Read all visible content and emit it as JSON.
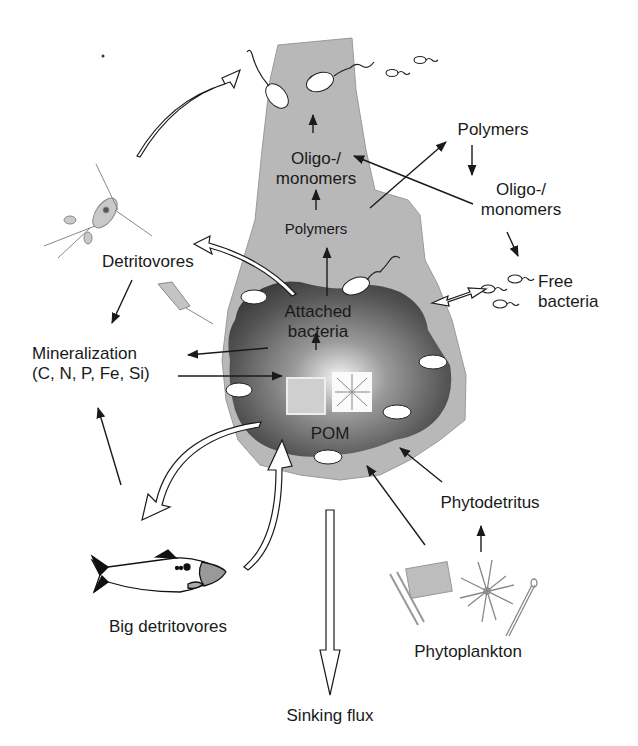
{
  "figure": {
    "colors": {
      "background": "#ffffff",
      "plume_gray": "#b5b5b5",
      "aggregate_dark": "#4a4a4a",
      "aggregate_center": "#f2f2f2",
      "bacteria_fill": "#ffffff",
      "ink": "#1a1a1a"
    }
  },
  "labels": {
    "plume_oligo_line1": "Oligo-/",
    "plume_oligo_line2": "monomers",
    "plume_polymers": "Polymers",
    "right_polymers": "Polymers",
    "right_oligo_line1": "Oligo-/",
    "right_oligo_line2": "monomers",
    "free_bacteria_line1": "Free",
    "free_bacteria_line2": "bacteria",
    "detritovores": "Detritovores",
    "mineralization_line1": "Mineralization",
    "mineralization_line2": "(C, N, P, Fe, Si)",
    "attached_line1": "Attached",
    "attached_line2": "bacteria",
    "pom": "POM",
    "phytodetritus": "Phytodetritus",
    "phytoplankton": "Phytoplankton",
    "big_detritovores": "Big detritovores",
    "sinking_flux": "Sinking flux"
  },
  "icons": {
    "copepod": "copepod-icon",
    "tintinnid": "tintinnid-icon",
    "fish": "fish-icon",
    "diatom_chain": "diatom-chain-icon",
    "star_diatom": "star-diatom-icon",
    "needle_diatom": "needle-diatom-icon",
    "bacterium": "bacterium-icon"
  },
  "flows": [
    {
      "from": "Attached bacteria",
      "to": "Polymers (plume)",
      "type": "arrow"
    },
    {
      "from": "Polymers (plume)",
      "to": "Oligo-/monomers (plume)",
      "type": "arrow"
    },
    {
      "from": "Oligo-/monomers (plume)",
      "to": "Attached bacteria (top)",
      "type": "arrow"
    },
    {
      "from": "Plume",
      "to": "Polymers (dissolved)",
      "type": "arrow"
    },
    {
      "from": "Polymers (dissolved)",
      "to": "Oligo-/monomers (dissolved)",
      "type": "arrow"
    },
    {
      "from": "Oligo-/monomers (dissolved)",
      "to": "Oligo-/monomers (plume)",
      "type": "arrow"
    },
    {
      "from": "Oligo-/monomers (dissolved)",
      "to": "Free bacteria",
      "type": "arrow"
    },
    {
      "from": "Free bacteria",
      "to": "Aggregate",
      "type": "double-hollow-arrow"
    },
    {
      "from": "Aggregate",
      "to": "Detritovores",
      "type": "hollow-arrow"
    },
    {
      "from": "Detritovores",
      "to": "Plume top",
      "type": "hollow-arrow"
    },
    {
      "from": "Detritovores",
      "to": "Mineralization",
      "type": "arrow"
    },
    {
      "from": "Attached bacteria",
      "to": "Mineralization",
      "type": "arrow"
    },
    {
      "from": "Mineralization",
      "to": "POM",
      "type": "arrow"
    },
    {
      "from": "Big detritovores",
      "to": "Mineralization",
      "type": "arrow"
    },
    {
      "from": "Aggregate",
      "to": "Big detritovores",
      "type": "hollow-arrow"
    },
    {
      "from": "Big detritovores",
      "to": "Aggregate",
      "type": "hollow-arrow"
    },
    {
      "from": "Phytoplankton",
      "to": "Phytodetritus",
      "type": "arrow"
    },
    {
      "from": "Phytodetritus",
      "to": "Aggregate",
      "type": "arrow"
    },
    {
      "from": "Phytoplankton",
      "to": "Aggregate",
      "type": "arrow"
    },
    {
      "from": "Aggregate",
      "to": "Sinking flux",
      "type": "hollow-arrow"
    }
  ]
}
